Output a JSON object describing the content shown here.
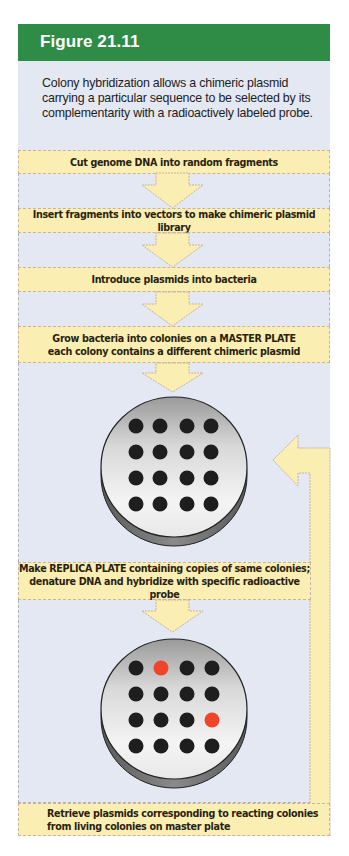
{
  "figure": {
    "title": "Figure 21.11",
    "caption": "Colony hybridization allows a chimeric plasmid carrying a particular sequence to be selected by its complementarity with a radioactively labeled probe."
  },
  "colors": {
    "header_green": "#2f8c46",
    "panel_background": "#e4e8f3",
    "step_box_yellow": "#fbeeb2",
    "arrow_yellow": "#fbeeb2",
    "colony_black": "#1e1e1e",
    "colony_reacting_red": "#f0452a"
  },
  "steps": [
    {
      "lines": [
        "Cut genome DNA into random fragments"
      ]
    },
    {
      "lines": [
        "Insert fragments into vectors to make chimeric plasmid library"
      ]
    },
    {
      "lines": [
        "Introduce plasmids into bacteria"
      ]
    },
    {
      "lines": [
        "Grow bacteria into colonies on a MASTER PLATE",
        "each colony contains a different chimeric plasmid"
      ]
    },
    {
      "lines": [
        "Make REPLICA PLATE containing copies of same colonies;",
        "denature DNA and hybridize with specific radioactive probe"
      ]
    },
    {
      "lines": [
        "Retrieve plasmids corresponding to reacting colonies",
        "from living colonies on master plate"
      ]
    }
  ],
  "plates": {
    "master": {
      "label": "MASTER PLATE",
      "grid": [
        [
          "black",
          "black",
          "black",
          "black"
        ],
        [
          "black",
          "black",
          "black",
          "black"
        ],
        [
          "black",
          "black",
          "black",
          "black"
        ],
        [
          "black",
          "black",
          "black",
          "black"
        ]
      ]
    },
    "replica": {
      "label": "REPLICA PLATE",
      "grid": [
        [
          "black",
          "red",
          "black",
          "black"
        ],
        [
          "black",
          "black",
          "black",
          "black"
        ],
        [
          "black",
          "black",
          "black",
          "red"
        ],
        [
          "black",
          "black",
          "black",
          "black"
        ]
      ]
    }
  },
  "icons": {
    "down_arrow": "down-arrow-icon",
    "return_arrow": "return-arrow-icon"
  }
}
